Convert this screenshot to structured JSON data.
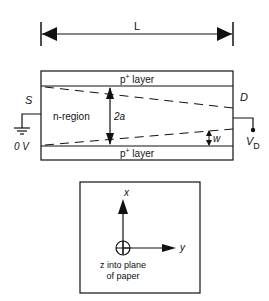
{
  "diagram": {
    "length_label": "L",
    "top_layer_label": "p",
    "top_layer_sup": "+",
    "top_layer_suffix": " layer",
    "bottom_layer_label": "p",
    "bottom_layer_sup": "+",
    "bottom_layer_suffix": " layer",
    "region_label": "n-region",
    "source_label": "S",
    "drain_label": "D",
    "ground_voltage_label": "0 V",
    "drain_voltage_label": "V",
    "drain_voltage_sub": "D",
    "channel_width_label": "2a",
    "depletion_width_label": "w"
  },
  "axes": {
    "x_label": "x",
    "y_label": "y",
    "z_caption_line1": "z into plane",
    "z_caption_line2": "of paper"
  },
  "colors": {
    "line": "#111111",
    "background": "#ffffff"
  }
}
